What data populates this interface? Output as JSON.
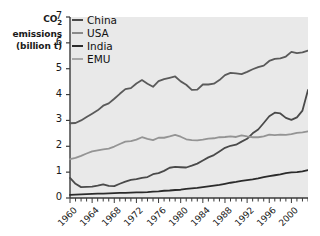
{
  "chart_data": {
    "type": "line",
    "title": "",
    "xlabel": "",
    "ylabel": "CO2 emissions (billion t)",
    "ylabel_line1": "CO",
    "ylabel_sub": "2",
    "ylabel_line2": "emissions",
    "ylabel_line3": "(billion t)",
    "ylim": [
      0,
      7
    ],
    "xlim": [
      1960,
      2003
    ],
    "ytick_values": [
      0,
      1,
      2,
      3,
      4,
      5,
      6,
      7
    ],
    "ytick_labels": [
      "0",
      "1",
      "2",
      "3",
      "4",
      "5",
      "6",
      "7"
    ],
    "xtick_labels": [
      "1960",
      "1964",
      "1968",
      "1972",
      "1976",
      "1980",
      "1984",
      "1988",
      "1992",
      "1996",
      "2000"
    ],
    "xtick_values": [
      1960,
      1964,
      1968,
      1972,
      1976,
      1980,
      1984,
      1988,
      1992,
      1996,
      2000
    ],
    "minor_tick_step": 1,
    "grid": false,
    "legend_position": "top-left-inside",
    "plot_background": "#e9e9e9",
    "axis_color": "#3a3a3a",
    "x": [
      1960,
      1961,
      1962,
      1963,
      1964,
      1965,
      1966,
      1967,
      1968,
      1969,
      1970,
      1971,
      1972,
      1973,
      1974,
      1975,
      1976,
      1977,
      1978,
      1979,
      1980,
      1981,
      1982,
      1983,
      1984,
      1985,
      1986,
      1987,
      1988,
      1989,
      1990,
      1991,
      1992,
      1993,
      1994,
      1995,
      1996,
      1997,
      1998,
      1999,
      2000,
      2001,
      2002,
      2003
    ],
    "series": [
      {
        "name": "China",
        "color": "#4a4a4a",
        "width": 1.8,
        "values": [
          0.78,
          0.55,
          0.42,
          0.43,
          0.44,
          0.48,
          0.53,
          0.47,
          0.46,
          0.55,
          0.63,
          0.7,
          0.73,
          0.78,
          0.81,
          0.92,
          0.96,
          1.05,
          1.17,
          1.2,
          1.19,
          1.18,
          1.25,
          1.33,
          1.45,
          1.57,
          1.66,
          1.8,
          1.94,
          2.02,
          2.06,
          2.18,
          2.29,
          2.5,
          2.65,
          2.9,
          3.16,
          3.3,
          3.27,
          3.1,
          3.02,
          3.12,
          3.38,
          4.18
        ]
      },
      {
        "name": "USA",
        "color": "#5a5a5a",
        "width": 1.8,
        "values": [
          2.89,
          2.9,
          3.0,
          3.13,
          3.26,
          3.39,
          3.57,
          3.66,
          3.84,
          4.03,
          4.21,
          4.25,
          4.43,
          4.56,
          4.42,
          4.3,
          4.52,
          4.6,
          4.65,
          4.7,
          4.51,
          4.38,
          4.18,
          4.19,
          4.39,
          4.39,
          4.42,
          4.56,
          4.75,
          4.84,
          4.82,
          4.79,
          4.88,
          4.98,
          5.06,
          5.12,
          5.3,
          5.38,
          5.4,
          5.47,
          5.65,
          5.6,
          5.63,
          5.7
        ]
      },
      {
        "name": "India",
        "color": "#2b2b2b",
        "width": 1.8,
        "values": [
          0.12,
          0.13,
          0.14,
          0.15,
          0.16,
          0.17,
          0.17,
          0.18,
          0.19,
          0.2,
          0.2,
          0.21,
          0.22,
          0.22,
          0.23,
          0.25,
          0.26,
          0.28,
          0.29,
          0.31,
          0.32,
          0.35,
          0.37,
          0.39,
          0.42,
          0.45,
          0.48,
          0.51,
          0.55,
          0.59,
          0.62,
          0.66,
          0.69,
          0.72,
          0.76,
          0.81,
          0.85,
          0.88,
          0.91,
          0.96,
          0.99,
          1.0,
          1.03,
          1.08
        ]
      },
      {
        "name": "EMU",
        "color": "#949494",
        "width": 1.8,
        "values": [
          1.5,
          1.55,
          1.63,
          1.72,
          1.8,
          1.84,
          1.88,
          1.91,
          1.99,
          2.09,
          2.18,
          2.2,
          2.26,
          2.35,
          2.29,
          2.24,
          2.33,
          2.33,
          2.38,
          2.44,
          2.37,
          2.27,
          2.24,
          2.23,
          2.26,
          2.3,
          2.31,
          2.35,
          2.36,
          2.38,
          2.36,
          2.42,
          2.38,
          2.35,
          2.35,
          2.38,
          2.45,
          2.43,
          2.45,
          2.44,
          2.47,
          2.52,
          2.54,
          2.58
        ]
      }
    ]
  },
  "legend": {
    "items": [
      {
        "label": "China",
        "color": "#4a4a4a"
      },
      {
        "label": "USA",
        "color": "#8a8a8a"
      },
      {
        "label": "India",
        "color": "#2b2b2b"
      },
      {
        "label": "EMU",
        "color": "#a8a8a8"
      }
    ]
  }
}
